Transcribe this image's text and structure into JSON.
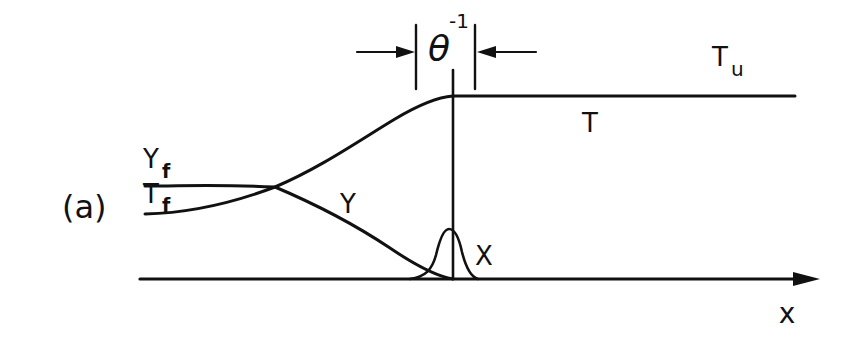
{
  "figure": {
    "panel_label": "(a)",
    "colors": {
      "ink": "#111111",
      "background": "#ffffff"
    },
    "labels": {
      "theta": "θ",
      "theta_exp": "-1",
      "T_u_main": "T",
      "T_u_sub": "u",
      "T": "T",
      "Y_f_main": "Y",
      "Y_f_sub": "f",
      "T_f_main": "T",
      "T_f_sub": "f",
      "Y": "Y",
      "X": "X",
      "x_axis": "x"
    },
    "curves": [
      {
        "name": "T",
        "description": "temperature rising from T_f to T_u, flat after reaction zone"
      },
      {
        "name": "Y",
        "description": "fuel mass fraction decreasing from Y_f to zero"
      },
      {
        "name": "X",
        "description": "narrow Gaussian reaction-zone profile"
      }
    ],
    "annotation": "reaction-zone thickness θ^-1 bracketed by inward arrows"
  }
}
